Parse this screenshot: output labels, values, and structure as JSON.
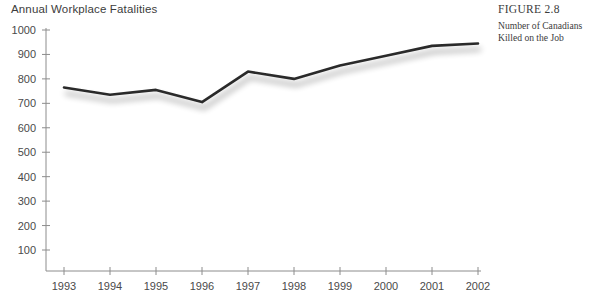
{
  "figure": {
    "number_label": "FIGURE 2.8",
    "caption_line1": "Number of Canadians",
    "caption_line2": "Killed on the Job"
  },
  "chart_data": {
    "type": "line",
    "title": "Annual Workplace Fatalities",
    "xlabel": "",
    "ylabel": "",
    "categories": [
      "1993",
      "1994",
      "1995",
      "1996",
      "1997",
      "1998",
      "1999",
      "2000",
      "2001",
      "2002"
    ],
    "values": [
      765,
      735,
      755,
      705,
      830,
      800,
      855,
      895,
      935,
      945
    ],
    "series": [
      {
        "name": "Annual Workplace Fatalities",
        "values": [
          765,
          735,
          755,
          705,
          830,
          800,
          855,
          895,
          935,
          945
        ]
      }
    ],
    "ylim": [
      0,
      1000
    ],
    "yticks": [
      100,
      200,
      300,
      400,
      500,
      600,
      700,
      800,
      900,
      1000
    ],
    "ytick_labels": [
      "100",
      "200",
      "300",
      "400",
      "500",
      "600",
      "700",
      "800",
      "900",
      "1000"
    ],
    "xtick_labels": [
      "1993",
      "1994",
      "1995",
      "1996",
      "1997",
      "1998",
      "1999",
      "2000",
      "2001",
      "2002"
    ],
    "grid": false,
    "legend": false,
    "line_color": "#2a2a2a",
    "axis_color": "#8c8c8c",
    "text_color": "#4a4a4a",
    "shadow_color": "#c9c9c9"
  }
}
